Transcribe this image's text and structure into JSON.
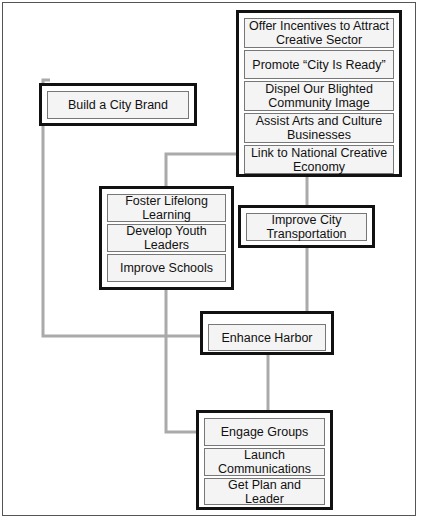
{
  "diagram": {
    "groups": [
      {
        "id": "creative",
        "items": [
          "Offer Incentives to Attract Creative Sector",
          "Promote “City Is Ready”",
          "Dispel Our Blighted Community Image",
          "Assist Arts and Culture Businesses",
          "Link to National Creative Economy"
        ]
      },
      {
        "id": "brand",
        "items": [
          "Build a City Brand"
        ]
      },
      {
        "id": "education",
        "items": [
          "Foster Lifelong Learning",
          "Develop Youth Leaders",
          "Improve Schools"
        ]
      },
      {
        "id": "transport",
        "items": [
          "Improve City Transportation"
        ]
      },
      {
        "id": "harbor",
        "items": [
          "Enhance Harbor"
        ]
      },
      {
        "id": "foundation",
        "items": [
          "Engage Groups",
          "Launch Communications",
          "Get Plan and Leader"
        ]
      }
    ],
    "connector_color": "#aaaaaa"
  }
}
